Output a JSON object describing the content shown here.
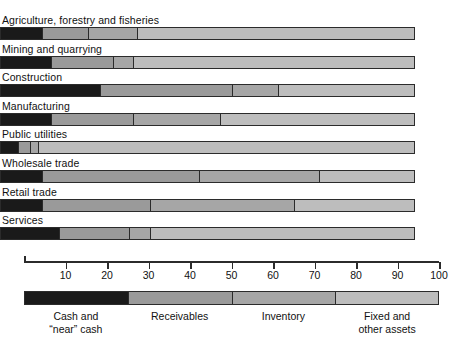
{
  "chart_data": {
    "type": "bar",
    "orientation": "horizontal",
    "stacked": true,
    "title": "",
    "xlabel": "",
    "ylabel": "",
    "xlim": [
      0,
      100
    ],
    "xticks": [
      10,
      20,
      30,
      40,
      50,
      60,
      70,
      80,
      90,
      100
    ],
    "xticklabels": [
      "10",
      "20",
      "30",
      "40",
      "50",
      "60",
      "70",
      "80",
      "90",
      "100"
    ],
    "grid": false,
    "legend_position": "bottom",
    "categories": [
      "Agriculture, forestry and fisheries",
      "Mining and quarrying",
      "Construction",
      "Manufacturing",
      "Public utilities",
      "Wholesale trade",
      "Retail trade",
      "Services"
    ],
    "series": [
      {
        "name": "Cash and “near” cash",
        "color": "#1a1a1a",
        "values": [
          10,
          12,
          24,
          12,
          4,
          10,
          10,
          14
        ]
      },
      {
        "name": "Receivables",
        "color": "#9a9a9a",
        "values": [
          11,
          15,
          32,
          20,
          3,
          38,
          26,
          17
        ]
      },
      {
        "name": "Inventory",
        "color": "#a6a6a6",
        "values": [
          12,
          5,
          11,
          21,
          2,
          29,
          35,
          5
        ]
      },
      {
        "name": "Fixed and other assets",
        "color": "#bdbdbd",
        "values": [
          67,
          68,
          33,
          47,
          91,
          23,
          29,
          64
        ]
      }
    ],
    "cumulative_boundaries": [
      [
        10,
        21,
        33,
        100
      ],
      [
        12,
        27,
        32,
        100
      ],
      [
        24,
        56,
        67,
        100
      ],
      [
        12,
        32,
        53,
        100
      ],
      [
        4,
        7,
        9,
        100
      ],
      [
        10,
        48,
        77,
        100
      ],
      [
        10,
        36,
        71,
        100
      ],
      [
        14,
        31,
        36,
        100
      ]
    ],
    "legend": [
      {
        "label_line1": "Cash and",
        "label_line2": "“near” cash",
        "color": "#1a1a1a",
        "span": [
          0,
          25
        ]
      },
      {
        "label_line1": "Receivables",
        "label_line2": "",
        "color": "#9a9a9a",
        "span": [
          25,
          50
        ]
      },
      {
        "label_line1": "Inventory",
        "label_line2": "",
        "color": "#a6a6a6",
        "span": [
          50,
          75
        ]
      },
      {
        "label_line1": "Fixed and",
        "label_line2": "other assets",
        "color": "#bdbdbd",
        "span": [
          75,
          100
        ]
      }
    ]
  },
  "colors": {
    "background": "#ffffff",
    "outline": "#2b2b2b",
    "text": "#111111",
    "cash": "#1a1a1a",
    "receivables": "#9a9a9a",
    "inventory": "#a6a6a6",
    "fixed": "#bdbdbd"
  }
}
